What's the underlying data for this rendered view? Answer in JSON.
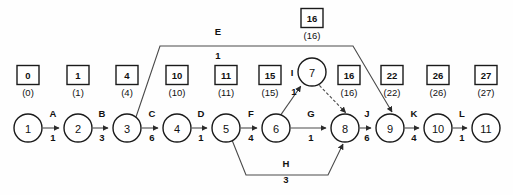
{
  "diagram": {
    "type": "activity-on-arrow-network",
    "nodes": [
      {
        "id": "1",
        "label": "1",
        "cx": 28,
        "cy": 128,
        "r": 14,
        "early": "0",
        "late": "(0)",
        "box_x": 28,
        "box_y": 75
      },
      {
        "id": "2",
        "label": "2",
        "cx": 78,
        "cy": 128,
        "r": 14,
        "early": "1",
        "late": "(1)",
        "box_x": 78,
        "box_y": 75
      },
      {
        "id": "3",
        "label": "3",
        "cx": 127,
        "cy": 128,
        "r": 14,
        "early": "4",
        "late": "(4)",
        "box_x": 127,
        "box_y": 75
      },
      {
        "id": "4",
        "label": "4",
        "cx": 177,
        "cy": 128,
        "r": 14,
        "early": "10",
        "late": "(10)",
        "box_x": 177,
        "box_y": 75
      },
      {
        "id": "5",
        "label": "5",
        "cx": 226,
        "cy": 128,
        "r": 14,
        "early": "11",
        "late": "(11)",
        "box_x": 226,
        "box_y": 75
      },
      {
        "id": "6",
        "label": "6",
        "cx": 276,
        "cy": 128,
        "r": 14,
        "early": "15",
        "late": "(15)",
        "box_x": 270,
        "box_y": 75
      },
      {
        "id": "7",
        "label": "7",
        "cx": 312,
        "cy": 72,
        "r": 14,
        "early": "16",
        "late": "(16)",
        "box_x": 312,
        "box_y": 18
      },
      {
        "id": "8",
        "label": "8",
        "cx": 345,
        "cy": 128,
        "r": 14,
        "early": "16",
        "late": "(16)",
        "box_x": 349,
        "box_y": 75
      },
      {
        "id": "9",
        "label": "9",
        "cx": 390,
        "cy": 128,
        "r": 14,
        "early": "22",
        "late": "(22)",
        "box_x": 392,
        "box_y": 75
      },
      {
        "id": "10",
        "label": "10",
        "cx": 438,
        "cy": 128,
        "r": 14,
        "early": "26",
        "late": "(26)",
        "box_x": 438,
        "box_y": 75
      },
      {
        "id": "11",
        "label": "11",
        "cx": 486,
        "cy": 128,
        "r": 14,
        "early": "27",
        "late": "(27)",
        "box_x": 486,
        "box_y": 75
      }
    ],
    "activities": [
      {
        "id": "A",
        "name": "A",
        "duration": "1",
        "from": "1",
        "to": "2",
        "label_x": 53,
        "label_y": 117,
        "dur_x": 53,
        "dur_y": 141,
        "dashed": false
      },
      {
        "id": "B",
        "name": "B",
        "duration": "3",
        "from": "2",
        "to": "3",
        "label_x": 102,
        "label_y": 117,
        "dur_x": 102,
        "dur_y": 141,
        "dashed": false
      },
      {
        "id": "C",
        "name": "C",
        "duration": "6",
        "from": "3",
        "to": "4",
        "label_x": 152,
        "label_y": 117,
        "dur_x": 152,
        "dur_y": 141,
        "dashed": false
      },
      {
        "id": "D",
        "name": "D",
        "duration": "1",
        "from": "4",
        "to": "5",
        "label_x": 201,
        "label_y": 117,
        "dur_x": 201,
        "dur_y": 141,
        "dashed": false
      },
      {
        "id": "F",
        "name": "F",
        "duration": "4",
        "from": "5",
        "to": "6",
        "label_x": 251,
        "label_y": 117,
        "dur_x": 251,
        "dur_y": 141,
        "dashed": false
      },
      {
        "id": "G",
        "name": "G",
        "duration": "1",
        "from": "6",
        "to": "8",
        "label_x": 311,
        "label_y": 117,
        "dur_x": 311,
        "dur_y": 141,
        "dashed": false
      },
      {
        "id": "J",
        "name": "J",
        "duration": "6",
        "from": "8",
        "to": "9",
        "label_x": 367,
        "label_y": 117,
        "dur_x": 367,
        "dur_y": 141,
        "dashed": false
      },
      {
        "id": "K",
        "name": "K",
        "duration": "4",
        "from": "9",
        "to": "10",
        "label_x": 414,
        "label_y": 117,
        "dur_x": 414,
        "dur_y": 141,
        "dashed": false
      },
      {
        "id": "L",
        "name": "L",
        "duration": "1",
        "from": "10",
        "to": "11",
        "label_x": 462,
        "label_y": 117,
        "dur_x": 462,
        "dur_y": 141,
        "dashed": false
      },
      {
        "id": "E",
        "name": "E",
        "duration": "1",
        "from": "3",
        "to": "9",
        "label_x": 218,
        "label_y": 35,
        "dur_x": 218,
        "dur_y": 59,
        "dashed": false
      },
      {
        "id": "H",
        "name": "H",
        "duration": "3",
        "from": "5",
        "to": "8",
        "label_x": 286,
        "label_y": 167,
        "dur_x": 286,
        "dur_y": 183,
        "dashed": false
      },
      {
        "id": "I",
        "name": "I",
        "duration": "1",
        "from": "6",
        "to": "7",
        "label_x": 292,
        "label_y": 76,
        "dur_x": 294,
        "dur_y": 95,
        "dashed": false
      },
      {
        "id": "DUMMY",
        "name": "",
        "duration": "",
        "from": "7",
        "to": "8",
        "label_x": 0,
        "label_y": 0,
        "dur_x": 0,
        "dur_y": 0,
        "dashed": true
      }
    ],
    "legend": {
      "box_meaning": "earliest event time",
      "paren_meaning": "latest event time"
    }
  }
}
